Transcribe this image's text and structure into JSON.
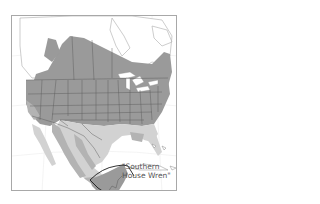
{
  "map": {
    "subject": "House Wren range map",
    "region": "North America",
    "colors": {
      "background": "#ffffff",
      "frame": "#a8a8a8",
      "land_outline": "#b8b8b8",
      "range_dark": "#9a9a9a",
      "range_mid": "#b3b3b3",
      "range_light": "#d2d2d2",
      "state_borders": "#5a5a5a",
      "water": "#ffffff",
      "highlight_outline": "#1a1a1a"
    },
    "legend_shades": [
      {
        "name": "breeding",
        "color": "#9a9a9a"
      },
      {
        "name": "year-round",
        "color": "#b3b3b3"
      },
      {
        "name": "nonbreeding",
        "color": "#d2d2d2"
      }
    ],
    "annotation": {
      "line1": "\"Southern",
      "line2": "House Wren\""
    }
  }
}
